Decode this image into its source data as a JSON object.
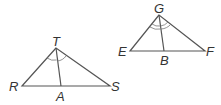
{
  "figure": {
    "triangle_1": {
      "vertices": {
        "top": "T",
        "left": "R",
        "right": "S"
      },
      "foot": "A",
      "angle_marks": "single arc",
      "label_T": "T",
      "label_R": "R",
      "label_S": "S",
      "label_A": "A"
    },
    "triangle_2": {
      "vertices": {
        "top": "G",
        "left": "E",
        "right": "F"
      },
      "foot": "B",
      "angle_marks": "double arc",
      "label_G": "G",
      "label_E": "E",
      "label_F": "F",
      "label_B": "B"
    },
    "colors": {
      "line": "#555555",
      "label": "#333333",
      "background": "#ffffff"
    }
  }
}
